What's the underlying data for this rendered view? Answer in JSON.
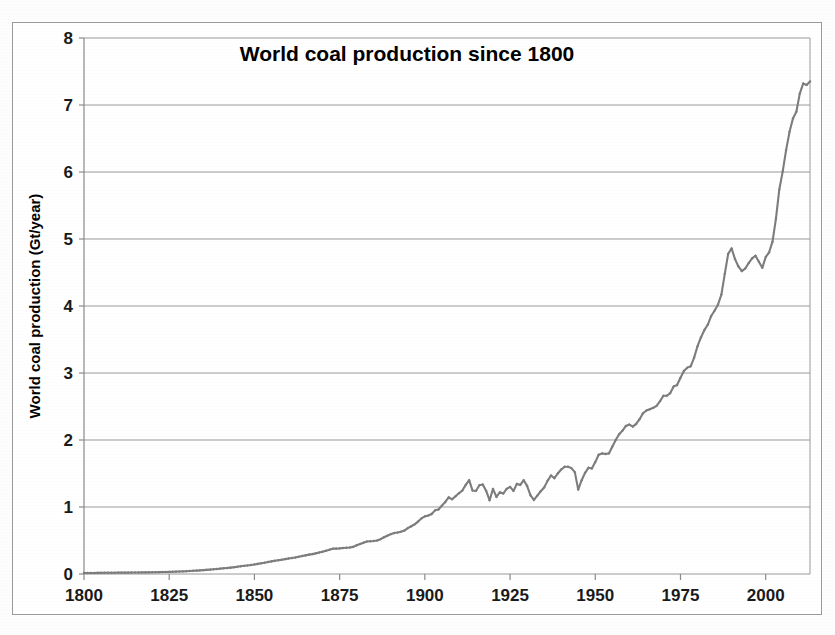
{
  "chart_data": {
    "type": "line",
    "title": "World coal production since 1800",
    "xlabel": "",
    "ylabel": "World coal production (Gt/year)",
    "xlim": [
      1800,
      2013
    ],
    "ylim": [
      0,
      8
    ],
    "grid": true,
    "legend": null,
    "legend_position": "none",
    "x_ticks": [
      1800,
      1825,
      1850,
      1875,
      1900,
      1925,
      1950,
      1975,
      2000
    ],
    "x_tick_labels": [
      "1800",
      "1825",
      "1850",
      "1875",
      "1900",
      "1925",
      "1950",
      "1975",
      "2000"
    ],
    "y_ticks": [
      0,
      1,
      2,
      3,
      4,
      5,
      6,
      7,
      8
    ],
    "y_tick_labels": [
      "0",
      "1",
      "2",
      "3",
      "4",
      "5",
      "6",
      "7",
      "8"
    ],
    "series": [
      {
        "name": "World coal production",
        "color": "#7d7d7d",
        "marker": "diamond",
        "x": [
          1800,
          1801,
          1802,
          1803,
          1804,
          1805,
          1806,
          1807,
          1808,
          1809,
          1810,
          1811,
          1812,
          1813,
          1814,
          1815,
          1816,
          1817,
          1818,
          1819,
          1820,
          1821,
          1822,
          1823,
          1824,
          1825,
          1826,
          1827,
          1828,
          1829,
          1830,
          1831,
          1832,
          1833,
          1834,
          1835,
          1836,
          1837,
          1838,
          1839,
          1840,
          1841,
          1842,
          1843,
          1844,
          1845,
          1846,
          1847,
          1848,
          1849,
          1850,
          1851,
          1852,
          1853,
          1854,
          1855,
          1856,
          1857,
          1858,
          1859,
          1860,
          1861,
          1862,
          1863,
          1864,
          1865,
          1866,
          1867,
          1868,
          1869,
          1870,
          1871,
          1872,
          1873,
          1874,
          1875,
          1876,
          1877,
          1878,
          1879,
          1880,
          1881,
          1882,
          1883,
          1884,
          1885,
          1886,
          1887,
          1888,
          1889,
          1890,
          1891,
          1892,
          1893,
          1894,
          1895,
          1896,
          1897,
          1898,
          1899,
          1900,
          1901,
          1902,
          1903,
          1904,
          1905,
          1906,
          1907,
          1908,
          1909,
          1910,
          1911,
          1912,
          1913,
          1914,
          1915,
          1916,
          1917,
          1918,
          1919,
          1920,
          1921,
          1922,
          1923,
          1924,
          1925,
          1926,
          1927,
          1928,
          1929,
          1930,
          1931,
          1932,
          1933,
          1934,
          1935,
          1936,
          1937,
          1938,
          1939,
          1940,
          1941,
          1942,
          1943,
          1944,
          1945,
          1946,
          1947,
          1948,
          1949,
          1950,
          1951,
          1952,
          1953,
          1954,
          1955,
          1956,
          1957,
          1958,
          1959,
          1960,
          1961,
          1962,
          1963,
          1964,
          1965,
          1966,
          1967,
          1968,
          1969,
          1970,
          1971,
          1972,
          1973,
          1974,
          1975,
          1976,
          1977,
          1978,
          1979,
          1980,
          1981,
          1982,
          1983,
          1984,
          1985,
          1986,
          1987,
          1988,
          1989,
          1990,
          1991,
          1992,
          1993,
          1994,
          1995,
          1996,
          1997,
          1998,
          1999,
          2000,
          2001,
          2002,
          2003,
          2004,
          2005,
          2006,
          2007,
          2008,
          2009,
          2010,
          2011,
          2012,
          2013
        ],
        "y": [
          0.015,
          0.015,
          0.016,
          0.016,
          0.017,
          0.017,
          0.018,
          0.018,
          0.019,
          0.019,
          0.02,
          0.02,
          0.021,
          0.021,
          0.022,
          0.022,
          0.023,
          0.024,
          0.024,
          0.025,
          0.026,
          0.027,
          0.028,
          0.029,
          0.03,
          0.031,
          0.033,
          0.035,
          0.037,
          0.039,
          0.042,
          0.045,
          0.048,
          0.051,
          0.054,
          0.058,
          0.062,
          0.066,
          0.07,
          0.075,
          0.08,
          0.085,
          0.09,
          0.095,
          0.101,
          0.108,
          0.115,
          0.122,
          0.128,
          0.135,
          0.143,
          0.151,
          0.16,
          0.169,
          0.178,
          0.188,
          0.197,
          0.205,
          0.213,
          0.222,
          0.232,
          0.239,
          0.247,
          0.258,
          0.268,
          0.278,
          0.289,
          0.297,
          0.308,
          0.32,
          0.333,
          0.347,
          0.362,
          0.378,
          0.378,
          0.382,
          0.388,
          0.392,
          0.396,
          0.405,
          0.43,
          0.448,
          0.466,
          0.485,
          0.489,
          0.492,
          0.5,
          0.52,
          0.548,
          0.572,
          0.595,
          0.612,
          0.62,
          0.632,
          0.648,
          0.685,
          0.712,
          0.74,
          0.782,
          0.83,
          0.86,
          0.872,
          0.895,
          0.95,
          0.962,
          1.02,
          1.075,
          1.145,
          1.115,
          1.16,
          1.205,
          1.245,
          1.33,
          1.4,
          1.245,
          1.24,
          1.325,
          1.335,
          1.24,
          1.1,
          1.27,
          1.15,
          1.22,
          1.2,
          1.27,
          1.3,
          1.24,
          1.345,
          1.33,
          1.4,
          1.315,
          1.175,
          1.105,
          1.17,
          1.235,
          1.29,
          1.39,
          1.47,
          1.43,
          1.5,
          1.56,
          1.6,
          1.6,
          1.58,
          1.52,
          1.26,
          1.4,
          1.51,
          1.585,
          1.575,
          1.67,
          1.78,
          1.8,
          1.79,
          1.8,
          1.9,
          2.0,
          2.085,
          2.14,
          2.21,
          2.23,
          2.2,
          2.24,
          2.31,
          2.4,
          2.44,
          2.46,
          2.48,
          2.51,
          2.58,
          2.66,
          2.66,
          2.7,
          2.8,
          2.82,
          2.93,
          3.03,
          3.08,
          3.1,
          3.23,
          3.4,
          3.53,
          3.64,
          3.72,
          3.85,
          3.93,
          4.02,
          4.17,
          4.48,
          4.78,
          4.86,
          4.7,
          4.59,
          4.52,
          4.56,
          4.64,
          4.71,
          4.75,
          4.66,
          4.57,
          4.73,
          4.8,
          4.96,
          5.3,
          5.74,
          6.01,
          6.33,
          6.6,
          6.8,
          6.9,
          7.17,
          7.32,
          7.3,
          7.35
        ]
      }
    ],
    "annotations": []
  },
  "axes": {
    "title": "World coal production since 1800",
    "y_axis_title": "World coal production (Gt/year)",
    "x_axis_title": ""
  },
  "style": {
    "line_color": "#7d7d7d",
    "grid_color": "#9a9a9a",
    "axis_color": "#8a8a8a",
    "text_color": "#111111",
    "background": "#ffffff",
    "frame_color": "#9a9a9a"
  }
}
